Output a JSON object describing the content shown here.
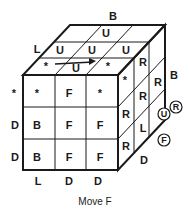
{
  "diagram": {
    "caption": "Move F",
    "front_face": [
      [
        "*",
        "F",
        "*"
      ],
      [
        "B",
        "F",
        "F"
      ],
      [
        "B",
        "F",
        "F"
      ]
    ],
    "top_face": [
      [
        "",
        "U",
        ""
      ],
      [
        "U",
        "U",
        "U"
      ],
      [
        "*",
        "U",
        "*"
      ]
    ],
    "right_face": [
      [
        "*",
        "R",
        ""
      ],
      [
        "R",
        "R",
        "R"
      ],
      [
        "R",
        "L",
        ""
      ]
    ],
    "outer_labels": {
      "back_top": "B",
      "left_top": "L",
      "right_back": "B",
      "left_row1": "*",
      "left_row2": "D",
      "left_row3": "D",
      "bottom_col1": "L",
      "bottom_col2": "D",
      "bottom_col3": "D",
      "right_bottom": "D"
    },
    "circled_labels": [
      "R",
      "U",
      "F"
    ],
    "arrow": "rotation-arrow"
  }
}
